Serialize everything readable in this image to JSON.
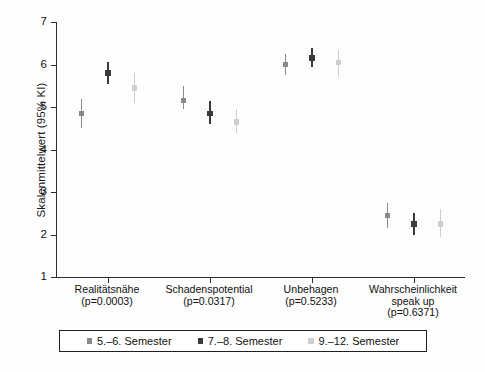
{
  "chart_data": {
    "type": "scatter",
    "title": "",
    "subtitle": "",
    "xlabel": "",
    "ylabel": "Skalenmittelwert (95% KI)",
    "ylim": [
      1,
      7
    ],
    "yticks": [
      1,
      2,
      3,
      4,
      5,
      6,
      7
    ],
    "ytick_labels": [
      "1",
      "2",
      "3",
      "4",
      "5",
      "6",
      "7"
    ],
    "grid": false,
    "legend_position": "bottom",
    "error_bars": "95% KI",
    "categories": [
      "Realitätsnähe",
      "Schadenspotential",
      "Unbehagen",
      "Wahrscheinlichkeit speak up"
    ],
    "category_annotations": [
      "(p=0.0003)",
      "(p=0.0317)",
      "(p=0.5233)",
      "(p=0.6371)"
    ],
    "category_labels_multiline": [
      [
        "Realitätsnähe"
      ],
      [
        "Schadenspotential"
      ],
      [
        "Unbehagen"
      ],
      [
        "Wahrscheinlichkeit",
        "speak up"
      ]
    ],
    "series": [
      {
        "name": "5.–6. Semester",
        "color": "#8a8a8a",
        "values": [
          4.85,
          5.15,
          6.0,
          2.45
        ],
        "ci_low": [
          4.5,
          4.95,
          5.75,
          2.15
        ],
        "ci_high": [
          5.2,
          5.5,
          6.25,
          2.75
        ]
      },
      {
        "name": "7.–8. Semester",
        "color": "#3a3a3a",
        "values": [
          5.8,
          4.85,
          6.15,
          2.25
        ],
        "ci_low": [
          5.55,
          4.6,
          5.95,
          2.0
        ],
        "ci_high": [
          6.05,
          5.15,
          6.4,
          2.5
        ]
      },
      {
        "name": "9.–12. Semester",
        "color": "#cfcfcf",
        "values": [
          5.45,
          4.65,
          6.05,
          2.25
        ],
        "ci_low": [
          5.1,
          4.4,
          5.7,
          1.95
        ],
        "ci_high": [
          5.8,
          4.95,
          6.35,
          2.6
        ]
      }
    ]
  },
  "legend": {
    "items": [
      {
        "label": "5.–6. Semester",
        "color": "#8a8a8a"
      },
      {
        "label": "7.–8. Semester",
        "color": "#3a3a3a"
      },
      {
        "label": "9.–12. Semester",
        "color": "#cfcfcf"
      }
    ]
  },
  "axis": {
    "y_title": "Skalenmittelwert (95% KI)"
  },
  "colors": {
    "axis": "#2b2b2b",
    "text": "#111111",
    "background": "#fdfdfd",
    "legend_border": "#1f1f1f"
  }
}
